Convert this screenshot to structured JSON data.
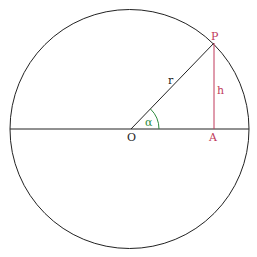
{
  "diagram": {
    "colors": {
      "stroke": "#222222",
      "highlight": "#c0395a",
      "angle": "#2e8b3e",
      "background": "#ffffff"
    },
    "labels": {
      "origin": "O",
      "point_p": "P",
      "point_a": "A",
      "radius": "r",
      "height": "h",
      "angle": "α"
    }
  }
}
